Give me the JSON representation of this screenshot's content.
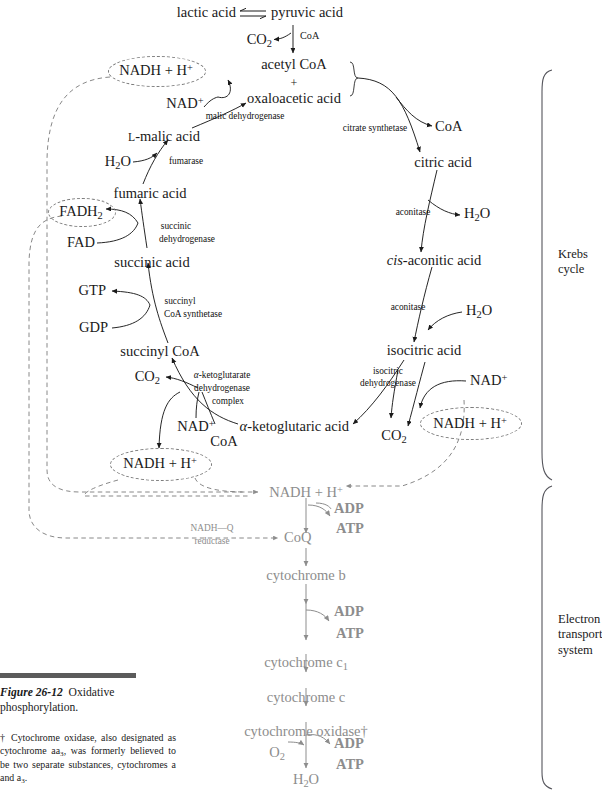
{
  "figure": {
    "caption_title": "Figure 26-12",
    "caption_text": "Oxidative phosphorylation.",
    "footnote": "† Cytochrome oxidase, also designated as cytochrome aa3, was formerly believed to be two separate substances, cytochromes a and a3."
  },
  "brackets": [
    {
      "name": "krebs",
      "line1": "Krebs",
      "line2": "cycle"
    },
    {
      "name": "ets",
      "line1": "Electron",
      "line2": "transport",
      "line3": "system"
    }
  ],
  "krebs": {
    "metabolites": [
      {
        "id": "lactic",
        "text": "lactic acid"
      },
      {
        "id": "pyruvic",
        "text": "pyruvic acid"
      },
      {
        "id": "co2_pyr",
        "text": "CO2"
      },
      {
        "id": "coa_pyr",
        "text": "CoA"
      },
      {
        "id": "acetylcoa",
        "text": "acetyl CoA"
      },
      {
        "id": "plus",
        "text": "+"
      },
      {
        "id": "oxaloacetic",
        "text": "oxaloacetic acid"
      },
      {
        "id": "coa_cit",
        "text": "CoA"
      },
      {
        "id": "citric",
        "text": "citric acid"
      },
      {
        "id": "h2o_acon1",
        "text": "H2O"
      },
      {
        "id": "cisaconitic",
        "text": "cis-aconitic acid"
      },
      {
        "id": "h2o_acon2",
        "text": "H2O"
      },
      {
        "id": "isocitric",
        "text": "isocitric acid"
      },
      {
        "id": "nad_iso",
        "text": "NAD+"
      },
      {
        "id": "nadh_iso",
        "text": "NADH + H+"
      },
      {
        "id": "co2_iso",
        "text": "CO2"
      },
      {
        "id": "ketoglutaric",
        "text": "α-ketoglutaric acid"
      },
      {
        "id": "co2_kg",
        "text": "CO2"
      },
      {
        "id": "nad_kg",
        "text": "NAD+"
      },
      {
        "id": "coa_kg",
        "text": "CoA"
      },
      {
        "id": "nadh_kg",
        "text": "NADH + H+"
      },
      {
        "id": "succinylcoa",
        "text": "succinyl CoA"
      },
      {
        "id": "gtp",
        "text": "GTP"
      },
      {
        "id": "gdp",
        "text": "GDP"
      },
      {
        "id": "succinic",
        "text": "succinic acid"
      },
      {
        "id": "fad",
        "text": "FAD"
      },
      {
        "id": "fadh2",
        "text": "FADH2"
      },
      {
        "id": "fumaric",
        "text": "fumaric acid"
      },
      {
        "id": "h2o_fum",
        "text": "H2O"
      },
      {
        "id": "malic",
        "text": "L-malic acid"
      },
      {
        "id": "nad_mal",
        "text": "NAD+"
      },
      {
        "id": "nadh_mal",
        "text": "NADH + H+"
      }
    ],
    "enzymes": [
      {
        "id": "malic_dh",
        "text": "malic dehydrogenase"
      },
      {
        "id": "citrate_syn",
        "text": "citrate synthetase"
      },
      {
        "id": "aconitase_1",
        "text": "aconitase"
      },
      {
        "id": "aconitase_2",
        "text": "aconitase"
      },
      {
        "id": "isocitric_dh_l1",
        "text": "isocitric"
      },
      {
        "id": "isocitric_dh_l2",
        "text": "dehydrogenase"
      },
      {
        "id": "kg_dh_l1",
        "text": "α-ketoglutarate"
      },
      {
        "id": "kg_dh_l2",
        "text": "dehydrogenase"
      },
      {
        "id": "kg_dh_l3",
        "text": "complex"
      },
      {
        "id": "succinyl_syn_l1",
        "text": "succinyl"
      },
      {
        "id": "succinyl_syn_l2",
        "text": "CoA synthetase"
      },
      {
        "id": "succinic_dh_l1",
        "text": "succinic"
      },
      {
        "id": "succinic_dh_l2",
        "text": "dehydrogenase"
      },
      {
        "id": "fumarase",
        "text": "fumarase"
      }
    ]
  },
  "ets": {
    "color": "#8d8d8d",
    "chain": [
      {
        "id": "nadh_etc",
        "text": "NADH + H+"
      },
      {
        "id": "coq",
        "text": "CoQ"
      },
      {
        "id": "cyt_b",
        "text": "cytochrome b"
      },
      {
        "id": "cyt_c1",
        "text": "cytochrome c1"
      },
      {
        "id": "cyt_c",
        "text": "cytochrome c"
      },
      {
        "id": "cyt_oxidase",
        "text": "cytochrome oxidase†"
      },
      {
        "id": "h2o_final",
        "text": "H2O"
      },
      {
        "id": "o2",
        "text": "O2"
      }
    ],
    "couples": [
      {
        "id": "couple1",
        "adp": "ADP",
        "atp": "ATP"
      },
      {
        "id": "couple2",
        "adp": "ADP",
        "atp": "ATP"
      },
      {
        "id": "couple3",
        "adp": "ADP",
        "atp": "ATP"
      }
    ],
    "enzymes": [
      {
        "id": "nadhq_l1",
        "text": "NADH—Q"
      },
      {
        "id": "nadhq_l2",
        "text": "reductase"
      }
    ]
  }
}
